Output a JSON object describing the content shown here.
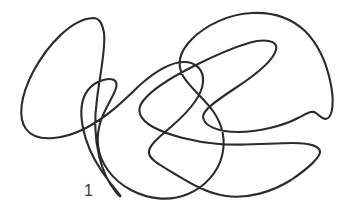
{
  "figure": {
    "kind": "knot-diagram",
    "title": "",
    "background_color": "#ffffff",
    "stroke_color": "#2b2b2b",
    "stroke_width": 2.1,
    "canvas": {
      "width": 351,
      "height": 219
    },
    "labels": [
      {
        "id": "crossing-label-1",
        "text": "1",
        "x": 84,
        "y": 196,
        "color": "#3a3a3a",
        "font_size": 16
      }
    ],
    "curves": [
      {
        "id": "knot-curve-main",
        "closed": true,
        "d": "M 93 18 C 72 19 48 44 33 72 C 20 97 18 118 26 129 C 36 143 63 140 86 128 C 112 114 129 95 141 84 C 156 71 170 62 184 62 C 196 62 204 70 203 82 C 202 97 187 113 172 126 C 158 138 148 146 149 153 C 150 160 160 165 175 174 C 190 183 206 193 226 196 C 248 199 272 192 291 180 C 309 168 320 157 320 152 C 320 146 309 143 293 143 C 272 143 245 146 219 144 C 193 142 168 135 153 127 C 139 119 136 110 143 101 C 152 89 172 77 194 66 C 218 54 242 44 257 41 C 271 39 278 43 276 50 C 273 61 254 76 234 89 C 216 101 203 110 203 117 C 204 126 218 132 238 132 C 258 132 283 126 298 118 C 308 113 312 110 316 113 C 320 116 324 121 328 118 C 333 114 334 101 331 85 C 327 64 318 44 305 31 C 291 18 272 12 252 13 C 229 14 206 25 192 39 C 179 52 177 65 183 76 C 190 88 204 98 213 111 C 222 124 226 140 222 156 C 218 172 205 187 188 194 C 169 202 148 199 131 190 C 112 180 100 163 98 145 C 96 127 104 112 110 101 C 116 90 119 83 114 80 C 108 77 95 81 88 90 C 81 99 80 113 83 128 C 86 143 93 158 101 170 C 109 182 116 190 119 194 C 122 198 120 197 116 192 C 110 185 103 172 99 156 C 95 139 94 120 97 99 C 100 74 106 48 104 33 C 102 22 99 18 93 18 Z"
      }
    ]
  }
}
